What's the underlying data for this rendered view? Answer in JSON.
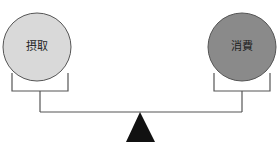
{
  "diagram": {
    "title": "",
    "left": {
      "label": "摂取",
      "fill": "#d9d9d9"
    },
    "right": {
      "label": "消費",
      "fill": "#8a8a8a"
    },
    "line_color": "#555555",
    "fulcrum_color": "#111111"
  }
}
